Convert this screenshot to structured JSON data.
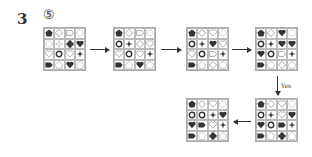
{
  "question_number": "3",
  "option_label": "⑤",
  "yes_label": "Yes",
  "grids": [
    {
      "id": "grid-1",
      "x": 43,
      "y": 27,
      "cells": [
        [
          "pentagon-f",
          "diamond-o",
          "tag-o",
          "flower-g"
        ],
        [
          "flower-g",
          "cross-g",
          "clover-f",
          "heart-f"
        ],
        [
          "heart-o",
          "ring",
          "heart-o",
          "star4-f"
        ],
        [
          "tag-f",
          "pentagon-o",
          "heart-f",
          "pentagon-o"
        ]
      ]
    },
    {
      "id": "grid-2",
      "x": 113,
      "y": 27,
      "cells": [
        [
          "pentagon-f",
          "diamond-o",
          "tag-o",
          "flower-g"
        ],
        [
          "ring",
          "cross-f",
          "diamond-o",
          "heart-o"
        ],
        [
          "heart-o",
          "ring",
          "heart-o",
          "star4-f"
        ],
        [
          "tag-f",
          "pentagon-o",
          "heart-f",
          "pentagon-o"
        ]
      ]
    },
    {
      "id": "grid-3",
      "x": 186,
      "y": 27,
      "cells": [
        [
          "pentagon-f",
          "diamond-o",
          "heart-o",
          "flower-g"
        ],
        [
          "ring",
          "cross-f",
          "heart-f",
          "heart-o"
        ],
        [
          "heart-o",
          "ring",
          "tag-o",
          "star4-f"
        ],
        [
          "tag-f",
          "pentagon-o",
          "diamond-o",
          "pentagon-o"
        ]
      ]
    },
    {
      "id": "grid-4",
      "x": 255,
      "y": 27,
      "cells": [
        [
          "pentagon-f",
          "diamond-o",
          "heart-f",
          "flower-g"
        ],
        [
          "ring",
          "cross-f",
          "heart-f",
          "heart-f"
        ],
        [
          "heart-f",
          "ring",
          "tag-o",
          "star4-f"
        ],
        [
          "tag-f",
          "pentagon-o",
          "diamond-o",
          "pentagon-o"
        ]
      ]
    },
    {
      "id": "grid-6",
      "x": 255,
      "y": 98,
      "cells": [
        [
          "pentagon-f",
          "diamond-o",
          "heart-o",
          "flower-g"
        ],
        [
          "ring",
          "cross-f",
          "heart-o",
          "heart-f"
        ],
        [
          "heart-f",
          "ring",
          "tag-f",
          "star4-f"
        ],
        [
          "tag-f",
          "pentagon-o",
          "clover-f",
          "pentagon-o"
        ]
      ]
    },
    {
      "id": "grid-5",
      "x": 186,
      "y": 98,
      "cells": [
        [
          "pentagon-f",
          "diamond-o",
          "heart-o",
          "flower-g"
        ],
        [
          "ring",
          "ring",
          "cross-f",
          "heart-f"
        ],
        [
          "heart-f",
          "tag-f",
          "heart-o",
          "star4-f"
        ],
        [
          "tag-f",
          "pentagon-o",
          "clover-f",
          "pentagon-o"
        ]
      ]
    }
  ],
  "arrows": [
    {
      "from": "grid-1",
      "to": "grid-2",
      "dir": "right"
    },
    {
      "from": "grid-2",
      "to": "grid-3",
      "dir": "right"
    },
    {
      "from": "grid-3",
      "to": "grid-4",
      "dir": "right"
    },
    {
      "from": "grid-4",
      "to": "grid-6",
      "dir": "down",
      "label": "Yes"
    },
    {
      "from": "grid-6",
      "to": "grid-5",
      "dir": "left"
    }
  ]
}
